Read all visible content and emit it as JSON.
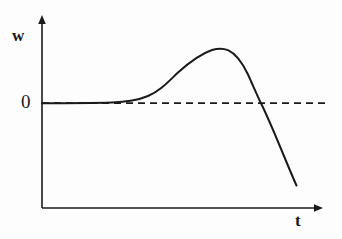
{
  "figure": {
    "title": "",
    "background_color": "#fdfdfd",
    "ink_color": "#1a1a1a"
  },
  "axes": {
    "y_axis": {
      "label": "w",
      "name": "vertical-axis",
      "arrow": true,
      "x_px": 42,
      "top_px": 16,
      "bottom_px": 208
    },
    "x_axis": {
      "label": "t",
      "name": "horizontal-axis",
      "arrow": true,
      "y_px": 208,
      "left_px": 42,
      "right_px": 322
    },
    "origin_label": "0"
  },
  "reference_line": {
    "name": "zero-level-dashed-line",
    "label": "0",
    "style": "dashed",
    "y_px": 103,
    "x_start_px": 42,
    "x_end_px": 326
  },
  "chart_data": {
    "type": "line",
    "title": "",
    "xlabel": "t",
    "ylabel": "w",
    "grid": false,
    "legend": null,
    "xlim": [
      0,
      1
    ],
    "ylim": [
      -1.05,
      0.62
    ],
    "annotations": [
      {
        "text": "0",
        "kind": "y-axis-tick-label",
        "value": 0
      },
      {
        "text": "w",
        "kind": "y-axis-name"
      },
      {
        "text": "t",
        "kind": "x-axis-name"
      }
    ],
    "series": [
      {
        "name": "w(t)",
        "style": "solid",
        "description": "Flat near zero, rises through an inflection to a rounded maximum, then falls steeply crossing zero and continuing downward.",
        "x": [
          0.0,
          0.05,
          0.1,
          0.15,
          0.2,
          0.25,
          0.286,
          0.32,
          0.36,
          0.4,
          0.44,
          0.48,
          0.52,
          0.56,
          0.6,
          0.629,
          0.66,
          0.7,
          0.74,
          0.781,
          0.82,
          0.86,
          0.9,
          0.91
        ],
        "y": [
          0.0,
          0.001,
          0.002,
          0.004,
          0.008,
          0.018,
          0.035,
          0.075,
          0.14,
          0.215,
          0.29,
          0.36,
          0.425,
          0.478,
          0.515,
          0.524,
          0.512,
          0.455,
          0.345,
          0.0,
          -0.33,
          -0.58,
          -0.805,
          -0.86
        ],
        "zero_crossing_x": 0.781,
        "peak": {
          "x": 0.629,
          "y": 0.524
        }
      },
      {
        "name": "zero reference",
        "style": "dashed",
        "x": [
          0.0,
          1.0
        ],
        "y": [
          0.0,
          0.0
        ]
      }
    ]
  },
  "curve": {
    "name": "response-curve",
    "path": "M 42,103.2 C 66,103.1 92,102.9 112,102.4 C 128,102.0 138,100.2 148,96.0 C 160,91.0 168,82.0 178,72.5 C 188,63.5 199,54.5 212,50.0 C 218,48.2 223,48.0 228,50.2 C 236,53.8 242,62.0 248,74.5 C 253,85.5 257,95.0 261,103.2 C 268,117.5 277,139.0 285,158.5 C 290,170.5 294,180.0 296.5,185.5"
  },
  "markers": {
    "peak_px": {
      "x": 218,
      "y": 49
    },
    "zero_crossing_px": {
      "x": 261,
      "y": 103
    },
    "curve_end_px": {
      "x": 296,
      "y": 185
    },
    "curve_start_px": {
      "x": 42,
      "y": 103
    }
  }
}
